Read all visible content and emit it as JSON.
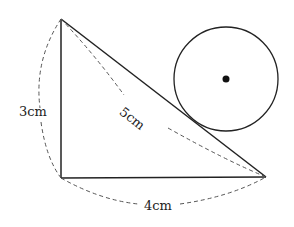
{
  "diagram": {
    "type": "right-triangle-with-circle",
    "labels": {
      "left_side": "3cm",
      "hypotenuse": "5cm",
      "bottom_side": "4cm"
    },
    "vertices": {
      "top": [
        61,
        19
      ],
      "bottom_left": [
        61,
        178
      ],
      "bottom_right": [
        266,
        177
      ]
    },
    "circle": {
      "center": [
        226,
        79
      ],
      "radius": 52,
      "center_dot": true
    },
    "colors": {
      "stroke": "#222222",
      "background": "#ffffff"
    }
  }
}
